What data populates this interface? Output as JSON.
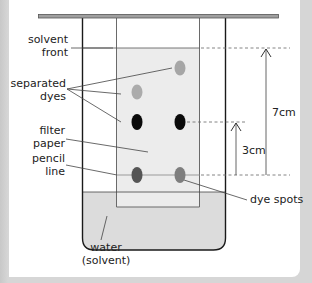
{
  "diagram": {
    "labels": {
      "solvent_front": [
        "solvent",
        "front"
      ],
      "separated_dyes": [
        "separated",
        "dyes"
      ],
      "filter_paper": [
        "filter",
        "paper"
      ],
      "pencil_line": [
        "pencil",
        "line"
      ],
      "water_solvent": [
        "water",
        "(solvent)"
      ],
      "dye_spots": "dye spots",
      "distance_solvent": "7cm",
      "distance_dye": "3cm"
    },
    "measurements": {
      "solvent_front_distance_cm": 7,
      "dye_distance_cm": 3
    },
    "spots": [
      {
        "name": "spot-top-right",
        "color": "#a6a6a6"
      },
      {
        "name": "spot-upper-left",
        "color": "#ababab"
      },
      {
        "name": "spot-black-left",
        "color": "#0a0a0a"
      },
      {
        "name": "spot-black-right",
        "color": "#0a0a0a"
      },
      {
        "name": "spot-start-left",
        "color": "#555555"
      },
      {
        "name": "spot-start-right",
        "color": "#7e7e7e"
      }
    ],
    "colors": {
      "background_strip": "#d6d6d6",
      "panel": "#ffffff",
      "paper": "#ececec",
      "water": "#dcdcdc",
      "outline": "#1a1a1a",
      "rod": "#9a9a9a"
    }
  }
}
